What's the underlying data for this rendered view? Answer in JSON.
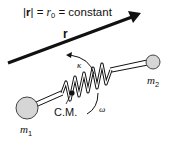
{
  "diagram": {
    "title": {
      "abs_open": "|",
      "vec": "r",
      "abs_close": "|",
      "eq1": " = ",
      "r0_base": "r",
      "r0_sub": "0",
      "eq2": " = constant"
    },
    "vector_label": "r",
    "spring_label": "κ",
    "rotation_label": "ω",
    "cm_label": "C.M.",
    "mass1": {
      "base": "m",
      "sub": "1"
    },
    "mass2": {
      "base": "m",
      "sub": "2"
    },
    "colors": {
      "line": "#111111",
      "ball_fill": "#d6d6d6",
      "ball_stroke": "#444444"
    }
  }
}
